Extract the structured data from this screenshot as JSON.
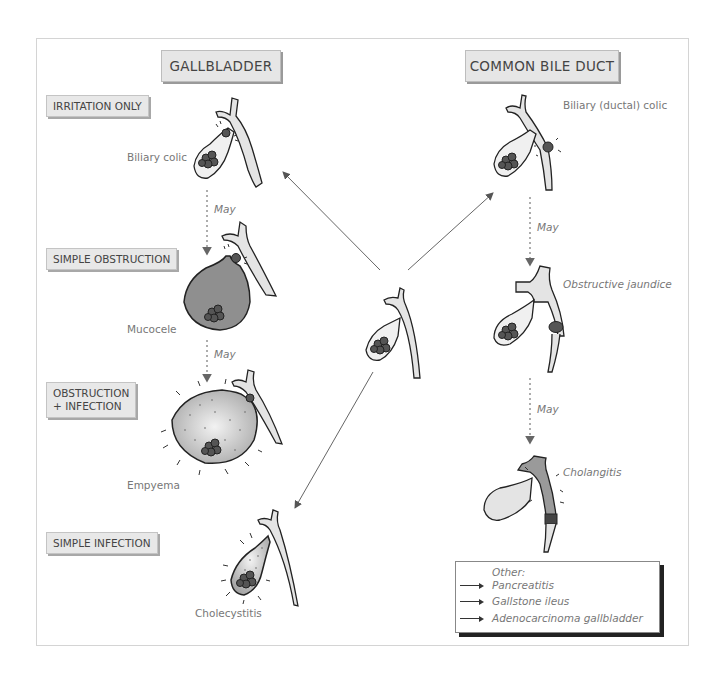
{
  "columns": {
    "gallbladder": {
      "title": "GALLBLADDER"
    },
    "common_bile_duct": {
      "title": "COMMON BILE DUCT"
    }
  },
  "gallbladder_stages": [
    {
      "tag": "IRRITATION ONLY",
      "condition": "Biliary colic"
    },
    {
      "tag": "SIMPLE OBSTRUCTION",
      "condition": "Mucocele"
    },
    {
      "tag_line1": "OBSTRUCTION",
      "tag_line2": "+ INFECTION",
      "condition": "Empyema"
    },
    {
      "tag": "SIMPLE INFECTION",
      "condition": "Cholecystitis"
    }
  ],
  "duct_stages": [
    {
      "condition": "Biliary (ductal) colic"
    },
    {
      "condition": "Obstructive jaundice"
    },
    {
      "condition": "Cholangitis"
    }
  ],
  "transitions": {
    "may_1": "May",
    "may_2": "May",
    "may_3": "May",
    "may_4": "May"
  },
  "legend": {
    "heading": "Other:",
    "items": [
      "Pancreatitis",
      "Gallstone ileus",
      "Adenocarcinoma gallbladder"
    ]
  },
  "colors": {
    "bile_fill": "#e4e4e4",
    "mucocele_fill": "#8f8f8f",
    "empyema_fill": "#c8c8c8",
    "stone": "#555555",
    "outline": "#222222",
    "arrow": "#666666"
  }
}
